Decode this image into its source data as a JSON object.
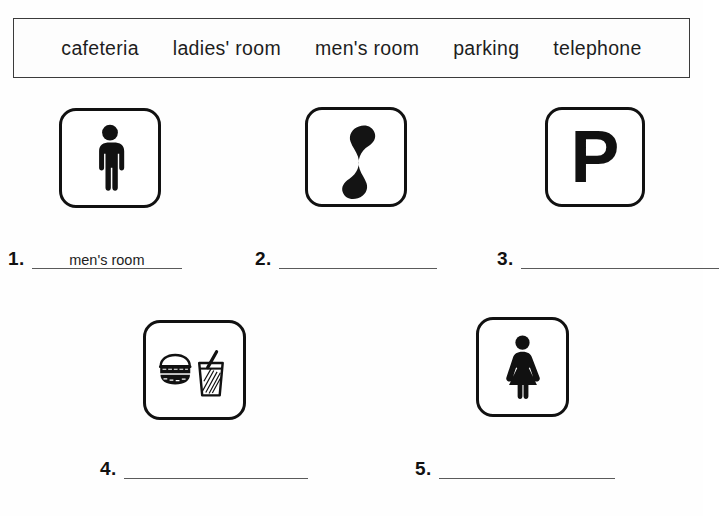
{
  "worksheet": {
    "word_bank": {
      "words": [
        "cafeteria",
        "ladies' room",
        "men's room",
        "parking",
        "telephone"
      ]
    },
    "icons": [
      {
        "id": "icon-mens-room",
        "symbol": "male-figure-icon"
      },
      {
        "id": "icon-telephone",
        "symbol": "telephone-handset-icon"
      },
      {
        "id": "icon-parking",
        "symbol": "letter-p-icon",
        "letter": "P"
      },
      {
        "id": "icon-cafeteria",
        "symbol": "burger-and-drink-icon"
      },
      {
        "id": "icon-ladies-room",
        "symbol": "female-figure-icon"
      }
    ],
    "answers": [
      {
        "number": "1.",
        "value": "men's room"
      },
      {
        "number": "2.",
        "value": ""
      },
      {
        "number": "3.",
        "value": ""
      },
      {
        "number": "4.",
        "value": ""
      },
      {
        "number": "5.",
        "value": ""
      }
    ]
  }
}
